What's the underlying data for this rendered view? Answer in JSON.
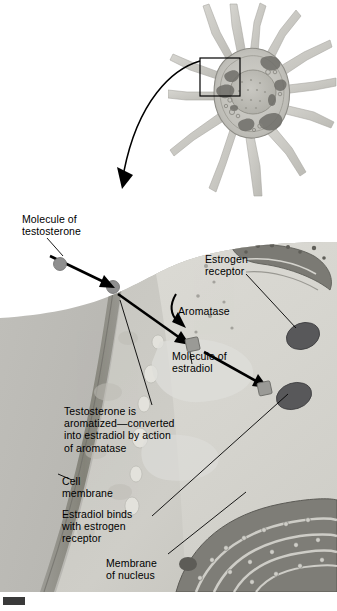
{
  "figure": {
    "domain": "biology-illustration"
  },
  "top_panel": {
    "name": "neuron-cell-body",
    "callout_box": "magnified-region",
    "description": "Neuron cell body with dendrites, nucleus and cytoplasmic organelles"
  },
  "link_arrow": {
    "name": "magnification-arrow",
    "description": "Curved arrow from callout box to detail panel"
  },
  "labels": {
    "testosterone": "Molecule of\ntestosterone",
    "estrogen_receptor": "Estrogen\nreceptor",
    "aromatase": "Aromatase",
    "estradiol": "Molecule of\nestradiol",
    "conversion": "Testosterone is\naromatized—converted\ninto estradiol by action\nof aromatase",
    "cell_membrane": "Cell\nmembrane",
    "binding": "Estradiol binds\nwith estrogen\nreceptor",
    "nuclear_membrane": "Membrane\nof nucleus"
  },
  "structures": {
    "testosterone_molecule_outside": "gray-circle",
    "testosterone_molecule_in_membrane": "gray-circle",
    "estradiol_molecule": "gray-square",
    "estradiol_molecule_bound": "gray-square",
    "estrogen_receptor_free": "dark-oval",
    "estrogen_receptor_bound": "dark-oval",
    "cell_membrane_band": "dark-gray-band",
    "nuclear_membrane": "rough-endoplasmic-reticulum-band",
    "vesicles": "light-ovals"
  },
  "colors": {
    "extracellular": "#b9b9b9",
    "membrane_dark": "#8d8d8d",
    "cytoplasm": "#c9c8c3",
    "nucleoplasm": "#d9d8d3",
    "nuclear_band": "#6f6f6b",
    "molecule_gray": "#8f8f8f",
    "receptor_dark": "#58585a",
    "line": "#000000",
    "page_background": "#ffffff"
  },
  "corner_mark": {
    "name": "registration-mark",
    "shape": "small-dark-rectangle"
  }
}
